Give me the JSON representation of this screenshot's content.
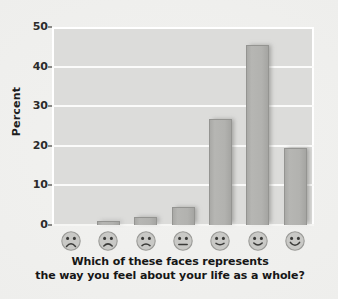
{
  "chart_data": {
    "type": "bar",
    "title": "",
    "subtitle": "",
    "xlabel": "Which of these faces represents the way you feel about your life as a whole?",
    "ylabel": "Percent",
    "categories": [
      "very sad face",
      "sad face",
      "slightly sad face",
      "neutral face",
      "slightly happy face",
      "happy face",
      "very happy face"
    ],
    "values": [
      0,
      1,
      2,
      4.5,
      26.7,
      45.5,
      19.5
    ],
    "ylim": [
      0,
      50
    ],
    "yticks": [
      0,
      10,
      20,
      30,
      40,
      50
    ],
    "ytick_labels": [
      "0",
      "10",
      "20",
      "30",
      "40",
      "50"
    ],
    "grid": true,
    "legend": "none",
    "bar_color": "#b2b2af",
    "bar_edge_color": "#949491",
    "plot_background": "#dcdcda",
    "gridline_color": "#fbfbfa",
    "figure_background": "#eeeeec",
    "text_color": "#1e1e1e"
  },
  "caption": {
    "line1": "Which of these faces represents",
    "line2": "the way you feel about your life as a whole?"
  },
  "axis": {
    "y_label": "Percent"
  },
  "faces": [
    {
      "name": "face-very-sad",
      "mouth": "frown-deep",
      "icon": "sad-face-icon"
    },
    {
      "name": "face-sad",
      "mouth": "frown",
      "icon": "sad-face-icon"
    },
    {
      "name": "face-slightly-sad",
      "mouth": "frown-slight",
      "icon": "slightly-sad-face-icon"
    },
    {
      "name": "face-neutral",
      "mouth": "flat",
      "icon": "neutral-face-icon"
    },
    {
      "name": "face-slightly-happy",
      "mouth": "smile-slight",
      "icon": "slightly-happy-face-icon"
    },
    {
      "name": "face-happy",
      "mouth": "smile",
      "icon": "happy-face-icon"
    },
    {
      "name": "face-very-happy",
      "mouth": "smile-deep",
      "icon": "very-happy-face-icon"
    }
  ]
}
